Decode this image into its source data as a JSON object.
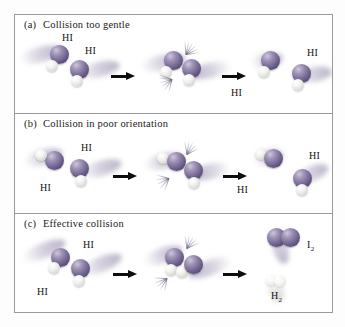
{
  "figure": {
    "border_color": "#9a9a9a",
    "background": "#ffffff"
  },
  "atom_colors": {
    "iodine": "#7a6d97",
    "hydrogen": "#e8e9e4"
  },
  "panels": [
    {
      "tag": "(a)",
      "caption": "Collision too gentle",
      "reactant_labels": [
        "HI",
        "HI"
      ],
      "product_labels": [
        "HI",
        "HI"
      ],
      "arrows": [
        "arrow-right",
        "arrow-right"
      ],
      "outcome": "bounce-apart-unchanged"
    },
    {
      "tag": "(b)",
      "caption": "Collision in poor orientation",
      "reactant_labels": [
        "HI",
        "HI"
      ],
      "product_labels": [
        "HI",
        "HI"
      ],
      "arrows": [
        "arrow-right",
        "arrow-right"
      ],
      "outcome": "bounce-apart-unchanged"
    },
    {
      "tag": "(c)",
      "caption": "Effective collision",
      "reactant_labels": [
        "HI",
        "HI"
      ],
      "product_labels": [
        "I",
        "H"
      ],
      "product_subscripts": [
        "2",
        "2"
      ],
      "arrows": [
        "arrow-right",
        "arrow-right"
      ],
      "outcome": "reaction-forms-I2-and-H2"
    }
  ]
}
